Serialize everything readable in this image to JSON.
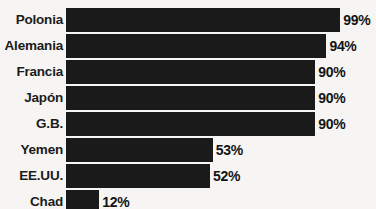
{
  "chart_data": {
    "type": "bar",
    "orientation": "horizontal",
    "title": "",
    "subtitle": "",
    "xlabel": "",
    "ylabel": "",
    "xlim": [
      0,
      100
    ],
    "grid": false,
    "legend": null,
    "unit": "%",
    "categories": [
      "Polonia",
      "Alemania",
      "Francia",
      "Japón",
      "G.B.",
      "Yemen",
      "EE.UU.",
      "Chad"
    ],
    "values": [
      99,
      94,
      90,
      90,
      90,
      53,
      52,
      12
    ],
    "value_labels": [
      "99%",
      "94%",
      "90%",
      "90%",
      "90%",
      "53%",
      "52%",
      "12%"
    ],
    "bar_color": "#1a1a1a",
    "background_color": "#f6f5f3",
    "text_color": "#1b1b1b",
    "rows": [
      {
        "category": "Polonia",
        "value": 99,
        "label": "99%"
      },
      {
        "category": "Alemania",
        "value": 94,
        "label": "94%"
      },
      {
        "category": "Francia",
        "value": 90,
        "label": "90%"
      },
      {
        "category": "Japón",
        "value": 90,
        "label": "90%"
      },
      {
        "category": "G.B.",
        "value": 90,
        "label": "90%"
      },
      {
        "category": "Yemen",
        "value": 53,
        "label": "53%"
      },
      {
        "category": "EE.UU.",
        "value": 52,
        "label": "52%"
      },
      {
        "category": "Chad",
        "value": 12,
        "label": "12%"
      }
    ]
  }
}
